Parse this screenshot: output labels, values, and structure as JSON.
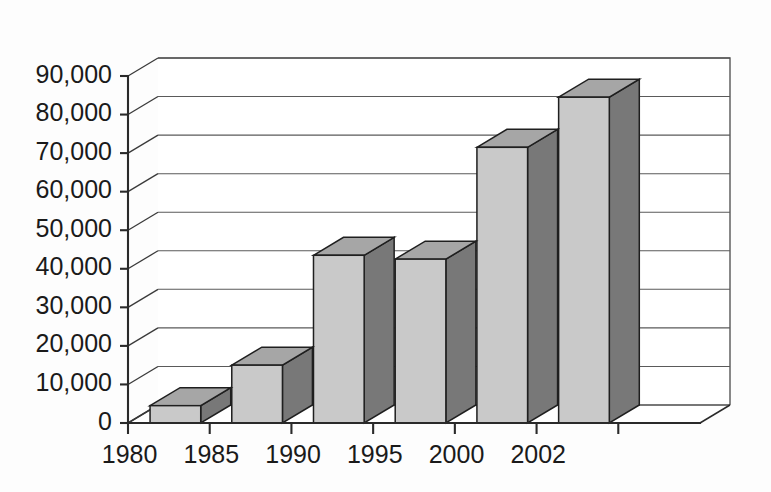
{
  "chart_data": {
    "type": "bar",
    "title": "",
    "subtitle": "",
    "xlabel": "",
    "ylabel": "",
    "categories": [
      "1980",
      "1985",
      "1990",
      "1995",
      "2000",
      "2002"
    ],
    "values": [
      4500,
      15000,
      43500,
      42500,
      71500,
      84500
    ],
    "ylim": [
      0,
      90000
    ],
    "ytick_values": [
      0,
      10000,
      20000,
      30000,
      40000,
      50000,
      60000,
      70000,
      80000,
      90000
    ],
    "ytick_labels": [
      "0",
      "10,000",
      "20,000",
      "30,000",
      "40,000",
      "50,000",
      "60,000",
      "70,000",
      "80,000",
      "90,000"
    ],
    "xtick_labels": [
      "1980",
      "1985",
      "1990",
      "1995",
      "2000",
      "2002"
    ],
    "grid": true,
    "grid_axis": "y",
    "legend": false,
    "legend_position": "none",
    "style": "3d-column",
    "series": [
      {
        "name": "Series 1",
        "values": [
          4500,
          15000,
          43500,
          42500,
          71500,
          84500
        ]
      }
    ],
    "annotations": []
  },
  "colors": {
    "bar_front": "#c9c9c9",
    "bar_side": "#787878",
    "bar_top": "#a6a6a6",
    "bar_outline": "#1f1f1f",
    "gridline": "#5a5a5a",
    "axis": "#2a2a2a",
    "text": "#1a1a1a",
    "background": "#fdfdfd",
    "wall": "#ffffff"
  },
  "geometry": {
    "plot_left": 128,
    "plot_right": 700,
    "baseline_y": 423,
    "top_y": 76,
    "depth_dx": 30,
    "depth_dy": -18
  }
}
